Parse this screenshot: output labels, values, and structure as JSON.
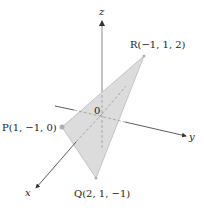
{
  "diagram": {
    "type": "3d-coordinate-plane-triangle",
    "axes": {
      "x_label": "x",
      "y_label": "y",
      "z_label": "z",
      "origin_label": "0"
    },
    "points": [
      {
        "name": "P",
        "coords": "(1, −1, 0)",
        "label": "P(1, −1, 0)"
      },
      {
        "name": "Q",
        "coords": "(2, 1, −1)",
        "label": "Q(2, 1, −1)"
      },
      {
        "name": "R",
        "coords": "(−1, 1, 2)",
        "label": "R(−1, 1, 2)"
      }
    ],
    "colors": {
      "triangle_fill": "#dcdcdc",
      "triangle_stroke": "#c4c4c4",
      "axis": "#333333",
      "z_axis": "#8a8a8a",
      "dashed": "#9a9a9a"
    }
  }
}
